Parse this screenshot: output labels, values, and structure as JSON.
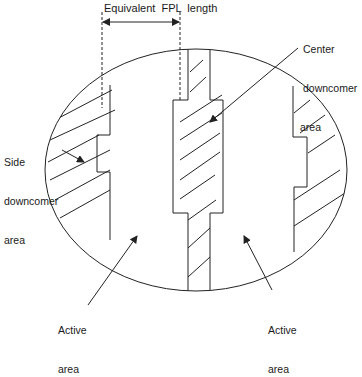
{
  "diagram": {
    "type": "tray-layout-cross-section",
    "labels": {
      "dimension": "Equivalent  FPL  length",
      "side_downcomer": [
        "Side",
        "downcomer",
        "area"
      ],
      "center_downcomer": [
        "Center",
        "downcomer",
        "area"
      ],
      "active_left": [
        "Active",
        "area"
      ],
      "active_right": [
        "Active",
        "area"
      ]
    },
    "colors": {
      "line": "#222222",
      "background": "#ffffff",
      "text": "#1a1a1a"
    }
  }
}
